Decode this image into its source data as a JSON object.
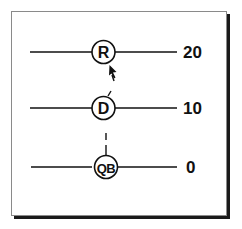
{
  "diagram": {
    "type": "football-route-diagram",
    "colors": {
      "ink": "#111111",
      "frame_border": "#8a8a8a",
      "shadow": "#1a1a1a",
      "background": "#ffffff"
    },
    "players": [
      {
        "id": "R",
        "label": "R",
        "yard_line": "20"
      },
      {
        "id": "D",
        "label": "D",
        "yard_line": "10"
      },
      {
        "id": "QB",
        "label": "QB",
        "yard_line": "0"
      }
    ],
    "yard_labels": [
      "20",
      "10",
      "0"
    ],
    "paths": [
      {
        "from": "QB",
        "to": "D",
        "style": "dashed"
      },
      {
        "from": "D",
        "to": "R",
        "style": "dashed-arrow"
      }
    ]
  }
}
